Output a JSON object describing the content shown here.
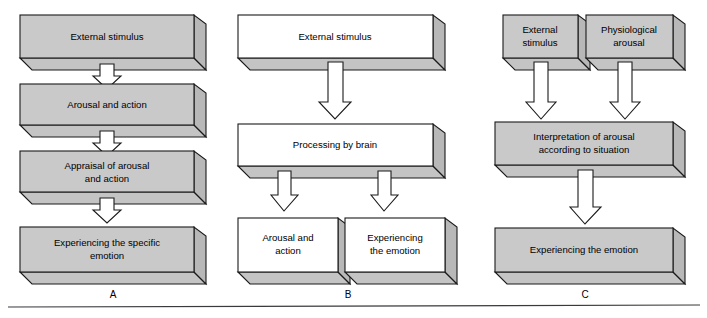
{
  "figure": {
    "type": "flowchart-diagram",
    "title": "",
    "background_color": "#ffffff",
    "box_fill_gray": "#c9c9c9",
    "box_fill_white": "#ffffff",
    "box_side_color": "#b8b8b8",
    "box_bottom_color": "#c4c4c4",
    "outline_color": "#1a1a1a",
    "arrow_fill": "#ffffff",
    "text_color": "#000000",
    "panel_count": 3
  },
  "panels": [
    {
      "letter": "A",
      "style": "gray",
      "nodes": [
        {
          "id": "a1",
          "lines": [
            "External stimulus"
          ]
        },
        {
          "id": "a2",
          "lines": [
            "Arousal and action"
          ]
        },
        {
          "id": "a3",
          "lines": [
            "Appraisal of arousal",
            "and action"
          ]
        },
        {
          "id": "a4",
          "lines": [
            "Experiencing the specific",
            "emotion"
          ]
        }
      ],
      "arrows": [
        {
          "from": "a1",
          "to": "a2"
        },
        {
          "from": "a2",
          "to": "a3"
        },
        {
          "from": "a3",
          "to": "a4"
        }
      ]
    },
    {
      "letter": "B",
      "style": "white",
      "nodes": [
        {
          "id": "b1",
          "lines": [
            "External stimulus"
          ]
        },
        {
          "id": "b2",
          "lines": [
            "Processing by brain"
          ]
        },
        {
          "id": "b3",
          "lines": [
            "Arousal and",
            "action"
          ]
        },
        {
          "id": "b4",
          "lines": [
            "Experiencing",
            "the emotion"
          ]
        }
      ],
      "arrows": [
        {
          "from": "b1",
          "to": "b2"
        },
        {
          "from": "b2",
          "to": "b3"
        },
        {
          "from": "b2",
          "to": "b4"
        }
      ]
    },
    {
      "letter": "C",
      "style": "gray",
      "nodes": [
        {
          "id": "c1",
          "lines": [
            "External",
            "stimulus"
          ]
        },
        {
          "id": "c2",
          "lines": [
            "Physiological",
            "arousal"
          ]
        },
        {
          "id": "c3",
          "lines": [
            "Interpretation of arousal",
            "according to situation"
          ]
        },
        {
          "id": "c4",
          "lines": [
            "Experiencing the emotion"
          ]
        }
      ],
      "arrows": [
        {
          "from": "c1",
          "to": "c3"
        },
        {
          "from": "c2",
          "to": "c3"
        },
        {
          "from": "c3",
          "to": "c4"
        }
      ]
    }
  ],
  "labels": {
    "panel_a": "A",
    "panel_b": "B",
    "panel_c": "C"
  },
  "text": {
    "a1_l1": "External stimulus",
    "a2_l1": "Arousal and action",
    "a3_l1": "Appraisal of arousal",
    "a3_l2": "and action",
    "a4_l1": "Experiencing the specific",
    "a4_l2": "emotion",
    "b1_l1": "External stimulus",
    "b2_l1": "Processing by brain",
    "b3_l1": "Arousal and",
    "b3_l2": "action",
    "b4_l1": "Experiencing",
    "b4_l2": "the emotion",
    "c1_l1": "External",
    "c1_l2": "stimulus",
    "c2_l1": "Physiological",
    "c2_l2": "arousal",
    "c3_l1": "Interpretation of arousal",
    "c3_l2": "according to situation",
    "c4_l1": "Experiencing the emotion"
  }
}
